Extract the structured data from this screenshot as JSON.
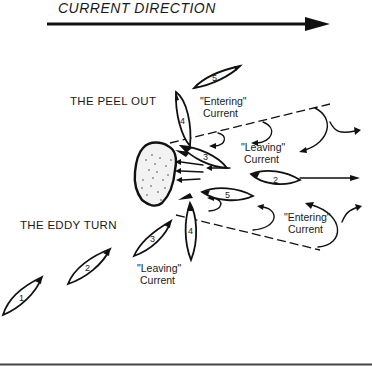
{
  "title": "CURRENT DIRECTION",
  "labels": {
    "peel_out": "THE PEEL OUT",
    "eddy_turn": "THE EDDY TURN",
    "entering_top": [
      "\"Entering\"",
      "Current"
    ],
    "leaving_top": [
      "\"Leaving\"",
      "Current"
    ],
    "entering_bottom": [
      "\"Entering\"",
      "Current"
    ],
    "leaving_bottom": [
      "\"Leaving\"",
      "Current"
    ]
  },
  "boats": {
    "eddy_turn": [
      "1",
      "2",
      "3",
      "4",
      "5"
    ],
    "peel_out": [
      "2",
      "3",
      "4",
      "5"
    ]
  },
  "colors": {
    "ink": "#111111",
    "background": "#ffffff"
  }
}
